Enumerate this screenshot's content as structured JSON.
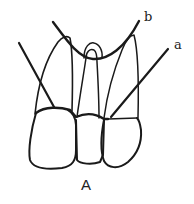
{
  "figure": {
    "caption": "A",
    "labels": {
      "a": "a",
      "b": "b"
    },
    "stroke_color": "#1a1a1a",
    "background": "#ffffff"
  }
}
